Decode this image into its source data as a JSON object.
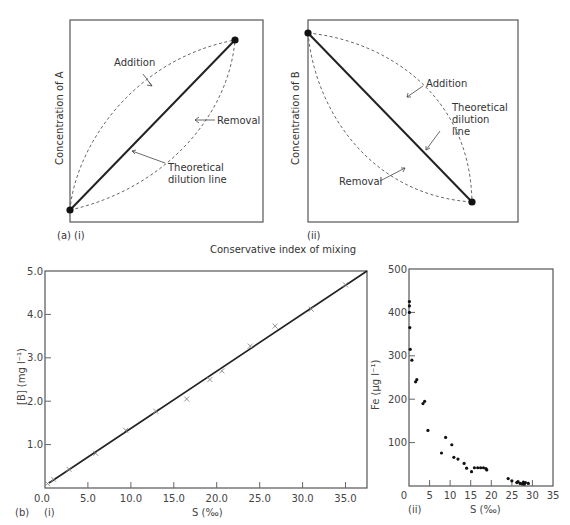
{
  "figure": {
    "panel_a": {
      "label": "(a) (i)",
      "sub_ii_label": "(ii)",
      "shared_xlabel": "Conservative index of mixing",
      "chart_i": {
        "ylabel": "Concentration of A",
        "annotations": {
          "addition": "Addition",
          "removal": "Removal",
          "dilution_line_1": "Theoretical",
          "dilution_line_2": "dilution line"
        }
      },
      "chart_ii": {
        "ylabel": "Concentration of B",
        "annotations": {
          "addition": "Addition",
          "removal": "Removal",
          "dilution_line_1": "Theoretical",
          "dilution_line_2": "dilution",
          "dilution_line_3": "line"
        }
      }
    },
    "panel_b": {
      "label_b": "(b)",
      "label_i": "(i)",
      "label_ii": "(ii)",
      "chart_i": {
        "ylabel": "[B] (mg l⁻¹)",
        "xlabel": "S (‰)",
        "xticks": [
          "0.0",
          "5.0",
          "10.0",
          "15.0",
          "20.0",
          "25.0",
          "30.0",
          "35.0"
        ],
        "yticks": [
          "1.0",
          "2.0",
          "3.0",
          "4.0",
          "5.0"
        ]
      },
      "chart_ii": {
        "ylabel": "Fe (µg l⁻¹)",
        "xlabel": "S (‰)",
        "xticks": [
          "0",
          "5",
          "10",
          "15",
          "20",
          "25",
          "30",
          "35"
        ],
        "yticks": [
          "100",
          "200",
          "300",
          "400",
          "500"
        ]
      }
    }
  },
  "chart_data": [
    {
      "type": "line",
      "title": "(a)(i)",
      "xlabel": "Conservative index of mixing",
      "ylabel": "Concentration of A",
      "series": [
        {
          "name": "Theoretical dilution line",
          "style": "solid",
          "x": [
            0,
            1
          ],
          "y": [
            0,
            1
          ]
        },
        {
          "name": "Addition",
          "style": "dashed",
          "x": [
            0,
            0.5,
            1
          ],
          "y": [
            0,
            0.72,
            1
          ]
        },
        {
          "name": "Removal",
          "style": "dashed",
          "x": [
            0,
            0.5,
            1
          ],
          "y": [
            0,
            0.28,
            1
          ]
        }
      ],
      "grid": false
    },
    {
      "type": "line",
      "title": "(a)(ii)",
      "xlabel": "Conservative index of mixing",
      "ylabel": "Concentration of B",
      "series": [
        {
          "name": "Theoretical dilution line",
          "style": "solid",
          "x": [
            0,
            1
          ],
          "y": [
            1,
            0
          ]
        },
        {
          "name": "Addition",
          "style": "dashed",
          "x": [
            0,
            0.5,
            1
          ],
          "y": [
            1,
            0.72,
            0
          ]
        },
        {
          "name": "Removal",
          "style": "dashed",
          "x": [
            0,
            0.5,
            1
          ],
          "y": [
            1,
            0.28,
            0
          ]
        }
      ],
      "grid": false
    },
    {
      "type": "scatter",
      "title": "(b)(i)",
      "xlabel": "S (‰)",
      "ylabel": "[B] (mg l⁻¹)",
      "xlim": [
        0,
        37.5
      ],
      "ylim": [
        0,
        5.0
      ],
      "series": [
        {
          "name": "observed",
          "marker": "x",
          "x": [
            0.3,
            1.0,
            2.8,
            5.9,
            9.4,
            12.9,
            16.5,
            19.2,
            20.6,
            23.9,
            26.8,
            31.0,
            35.0
          ],
          "y": [
            0.1,
            0.2,
            0.43,
            0.8,
            1.33,
            1.77,
            2.05,
            2.5,
            2.7,
            3.27,
            3.73,
            4.12,
            4.68
          ]
        },
        {
          "name": "dilution line",
          "style": "solid",
          "x": [
            0.5,
            37.5
          ],
          "y": [
            0.12,
            5.0
          ]
        }
      ],
      "grid": false
    },
    {
      "type": "scatter",
      "title": "(b)(ii)",
      "xlabel": "S (‰)",
      "ylabel": "Fe (µg l⁻¹)",
      "xlim": [
        0,
        35
      ],
      "ylim": [
        0,
        500
      ],
      "series": [
        {
          "name": "Fe",
          "x": [
            0.1,
            0.1,
            0.1,
            0.2,
            0.3,
            0.7,
            1.6,
            1.9,
            3.4,
            3.8,
            4.6,
            7.9,
            8.9,
            10.4,
            10.9,
            11.9,
            13.4,
            14.0,
            15.2,
            15.9,
            16.7,
            17.4,
            18.1,
            18.7,
            18.9,
            24.1,
            25.0,
            26.2,
            26.5,
            27.0,
            27.5,
            27.8,
            28.0,
            28.3,
            29.0
          ],
          "y": [
            425,
            415,
            400,
            365,
            315,
            290,
            240,
            245,
            190,
            195,
            128,
            76,
            112,
            95,
            66,
            62,
            52,
            41,
            33,
            42,
            42,
            42,
            42,
            40,
            37,
            17,
            12,
            8,
            10,
            6,
            5,
            9,
            4,
            8,
            6
          ]
        }
      ],
      "grid": false
    }
  ]
}
